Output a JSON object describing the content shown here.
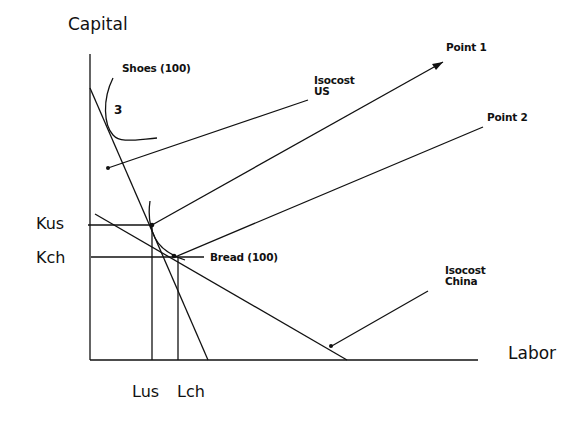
{
  "diagram": {
    "type": "isocost-isoquant",
    "axes": {
      "y_label": "Capital",
      "x_label": "Labor"
    },
    "ticks": {
      "y": [
        "Kus",
        "Kch"
      ],
      "x": [
        "Lus",
        "Lch"
      ]
    },
    "curves": {
      "shoes": "Shoes (100)",
      "shoes_marker": "3",
      "bread": "Bread (100)"
    },
    "lines": {
      "isocost_us": [
        "Isocost",
        "US"
      ],
      "isocost_china": [
        "Isocost",
        "China"
      ]
    },
    "points": {
      "point1": "Point 1",
      "point2": "Point 2"
    }
  }
}
